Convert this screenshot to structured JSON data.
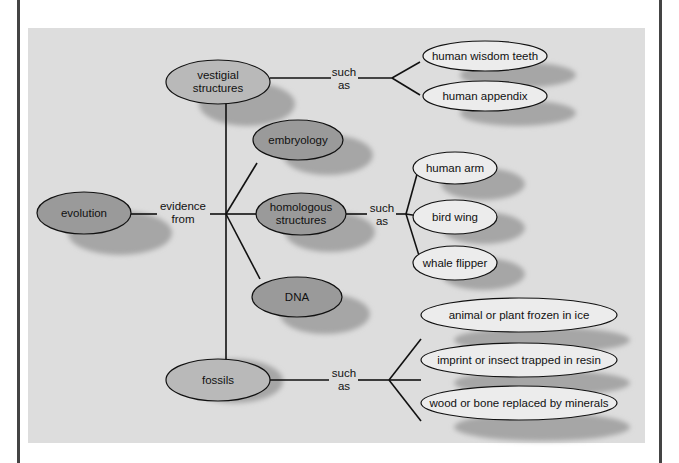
{
  "diagram": {
    "type": "concept-map",
    "root": "evolution",
    "connector_root": "evidence from",
    "categories": [
      {
        "label_lines": [
          "vestigial",
          "structures"
        ],
        "connector": [
          "such",
          "as"
        ],
        "examples": [
          "human wisdom teeth",
          "human appendix"
        ]
      },
      {
        "label_lines": [
          "embryology"
        ],
        "connector": null,
        "examples": []
      },
      {
        "label_lines": [
          "homologous",
          "structures"
        ],
        "connector": [
          "such",
          "as"
        ],
        "examples": [
          "human arm",
          "bird wing",
          "whale flipper"
        ]
      },
      {
        "label_lines": [
          "DNA"
        ],
        "connector": null,
        "examples": []
      },
      {
        "label_lines": [
          "fossils"
        ],
        "connector": [
          "such",
          "as"
        ],
        "examples": [
          "animal or plant frozen in ice",
          "imprint or insect trapped in resin",
          "wood or bone replaced by minerals"
        ]
      }
    ],
    "colors": {
      "dark_node": "#9a9a9a",
      "medium_node": "#b9b9b9",
      "light_node": "#ececec",
      "shadow": "#a8a8a8",
      "panel": "#dddddd",
      "line": "#111111"
    }
  },
  "nodes": {
    "evolution": "evolution",
    "vestigial_1": "vestigial",
    "vestigial_2": "structures",
    "embryology": "embryology",
    "homologous_1": "homologous",
    "homologous_2": "structures",
    "dna": "DNA",
    "fossils": "fossils",
    "wisdom_teeth": "human wisdom teeth",
    "appendix": "human appendix",
    "human_arm": "human arm",
    "bird_wing": "bird wing",
    "whale_flipper": "whale flipper",
    "frozen": "animal or plant frozen in ice",
    "resin": "imprint or insect trapped in resin",
    "minerals": "wood or bone replaced by minerals"
  },
  "connectors": {
    "evidence_1": "evidence",
    "evidence_2": "from",
    "such": "such",
    "as": "as"
  }
}
